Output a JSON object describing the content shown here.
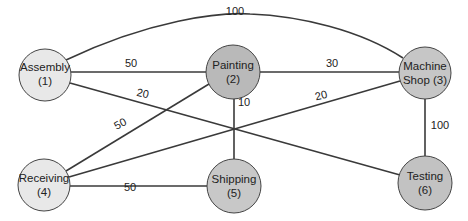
{
  "diagram": {
    "type": "weighted-graph",
    "nodes": [
      {
        "id": 1,
        "name": "Assembly",
        "line1": "Assembly",
        "line2": "(1)",
        "x": 45,
        "y": 75,
        "r": 26,
        "fill": "#e8e8e8"
      },
      {
        "id": 2,
        "name": "Painting",
        "line1": "Painting",
        "line2": "(2)",
        "x": 233,
        "y": 72,
        "r": 27,
        "fill": "#b9b9b9"
      },
      {
        "id": 3,
        "name": "Machine Shop",
        "line1": "Machine",
        "line2": "Shop (3)",
        "x": 425,
        "y": 73,
        "r": 26,
        "fill": "#c6c6c6"
      },
      {
        "id": 4,
        "name": "Receiving",
        "line1": "Receiving",
        "line2": "(4)",
        "x": 44,
        "y": 185,
        "r": 26,
        "fill": "#e8e8e8"
      },
      {
        "id": 5,
        "name": "Shipping",
        "line1": "Shipping",
        "line2": "(5)",
        "x": 234,
        "y": 186,
        "r": 27,
        "fill": "#c8c8c8"
      },
      {
        "id": 6,
        "name": "Testing",
        "line1": "Testing",
        "line2": "(6)",
        "x": 425,
        "y": 183,
        "r": 27,
        "fill": "#c2c2c2"
      }
    ],
    "edges": [
      {
        "from": 1,
        "to": 3,
        "weight": "100",
        "label_x": 235,
        "label_y": 15,
        "rotate": 0
      },
      {
        "from": 1,
        "to": 2,
        "weight": "50",
        "label_x": 131,
        "label_y": 67,
        "rotate": 0
      },
      {
        "from": 1,
        "to": 6,
        "weight": "20",
        "label_x": 142,
        "label_y": 97,
        "rotate": 12
      },
      {
        "from": 2,
        "to": 3,
        "weight": "30",
        "label_x": 332,
        "label_y": 67,
        "rotate": 0
      },
      {
        "from": 2,
        "to": 4,
        "weight": "50",
        "label_x": 122,
        "label_y": 127,
        "rotate": -28
      },
      {
        "from": 2,
        "to": 5,
        "weight": "10",
        "label_x": 244,
        "label_y": 106,
        "rotate": 0
      },
      {
        "from": 3,
        "to": 4,
        "weight": "20",
        "label_x": 322,
        "label_y": 99,
        "rotate": -14
      },
      {
        "from": 3,
        "to": 6,
        "weight": "100",
        "label_x": 440,
        "label_y": 129,
        "rotate": 0
      },
      {
        "from": 4,
        "to": 5,
        "weight": "50",
        "label_x": 130,
        "label_y": 191,
        "rotate": 0
      }
    ]
  }
}
